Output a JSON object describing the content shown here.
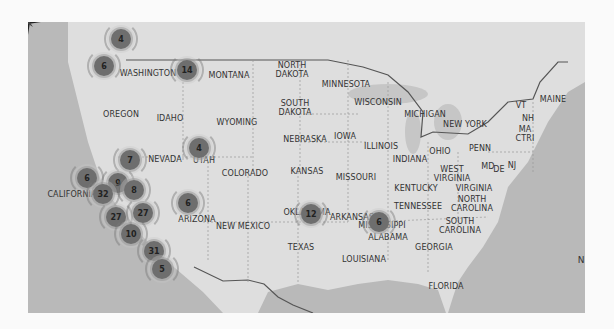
{
  "map": {
    "states": [
      {
        "name": "WASHINGTON",
        "x": 148,
        "y": 73
      },
      {
        "name": "MONTANA",
        "x": 229,
        "y": 75
      },
      {
        "name": "NORTH\nDAKOTA",
        "x": 292,
        "y": 70
      },
      {
        "name": "MINNESOTA",
        "x": 346,
        "y": 84
      },
      {
        "name": "OREGON",
        "x": 121,
        "y": 114
      },
      {
        "name": "IDAHO",
        "x": 170,
        "y": 118
      },
      {
        "name": "WYOMING",
        "x": 237,
        "y": 122
      },
      {
        "name": "SOUTH\nDAKOTA",
        "x": 295,
        "y": 108
      },
      {
        "name": "WISCONSIN",
        "x": 378,
        "y": 102
      },
      {
        "name": "MICHIGAN",
        "x": 425,
        "y": 114
      },
      {
        "name": "NEBRASKA",
        "x": 305,
        "y": 139
      },
      {
        "name": "IOWA",
        "x": 345,
        "y": 136
      },
      {
        "name": "ILLINOIS",
        "x": 381,
        "y": 146
      },
      {
        "name": "INDIANA",
        "x": 410,
        "y": 159
      },
      {
        "name": "OHIO",
        "x": 440,
        "y": 151
      },
      {
        "name": "PENN",
        "x": 480,
        "y": 148
      },
      {
        "name": "NEW YORK",
        "x": 465,
        "y": 124
      },
      {
        "name": "VT",
        "x": 521,
        "y": 105
      },
      {
        "name": "NH",
        "x": 528,
        "y": 118
      },
      {
        "name": "MA\nCTRI",
        "x": 525,
        "y": 134
      },
      {
        "name": "MAINE",
        "x": 553,
        "y": 99
      },
      {
        "name": "NEVADA",
        "x": 165,
        "y": 159
      },
      {
        "name": "UTAH",
        "x": 204,
        "y": 160
      },
      {
        "name": "COLORADO",
        "x": 245,
        "y": 173
      },
      {
        "name": "KANSAS",
        "x": 307,
        "y": 171
      },
      {
        "name": "MISSOURI",
        "x": 356,
        "y": 177
      },
      {
        "name": "WEST\nVIRGINIA",
        "x": 452,
        "y": 174
      },
      {
        "name": "MD",
        "x": 488,
        "y": 166
      },
      {
        "name": "DE",
        "x": 499,
        "y": 169
      },
      {
        "name": "NJ",
        "x": 512,
        "y": 165
      },
      {
        "name": "KENTUCKY",
        "x": 416,
        "y": 188
      },
      {
        "name": "VIRGINIA",
        "x": 474,
        "y": 188
      },
      {
        "name": "NORTH\nCAROLINA",
        "x": 472,
        "y": 204
      },
      {
        "name": "TENNESSEE",
        "x": 418,
        "y": 206
      },
      {
        "name": "CALIFORNIA",
        "x": 72,
        "y": 194
      },
      {
        "name": "ARIZONA",
        "x": 197,
        "y": 219
      },
      {
        "name": "NEW MEXICO",
        "x": 243,
        "y": 226
      },
      {
        "name": "OKLAHOMA",
        "x": 307,
        "y": 212
      },
      {
        "name": "ARKANSAS",
        "x": 352,
        "y": 217
      },
      {
        "name": "MISSISSIPPI",
        "x": 382,
        "y": 225
      },
      {
        "name": "SOUTH\nCAROLINA",
        "x": 460,
        "y": 226
      },
      {
        "name": "ALABAMA",
        "x": 388,
        "y": 237
      },
      {
        "name": "GEORGIA",
        "x": 434,
        "y": 247
      },
      {
        "name": "TEXAS",
        "x": 301,
        "y": 247
      },
      {
        "name": "LOUISIANA",
        "x": 364,
        "y": 259
      },
      {
        "name": "FLORIDA",
        "x": 446,
        "y": 286
      }
    ],
    "clusters": [
      {
        "count": "4",
        "x": 121,
        "y": 17
      },
      {
        "count": "6",
        "x": 104,
        "y": 44
      },
      {
        "count": "14",
        "x": 187,
        "y": 48
      },
      {
        "count": "4",
        "x": 199,
        "y": 126
      },
      {
        "count": "7",
        "x": 130,
        "y": 138
      },
      {
        "count": "6",
        "x": 87,
        "y": 156
      },
      {
        "count": "9",
        "x": 118,
        "y": 161
      },
      {
        "count": "8",
        "x": 134,
        "y": 168
      },
      {
        "count": "32",
        "x": 103,
        "y": 172
      },
      {
        "count": "27",
        "x": 116,
        "y": 195
      },
      {
        "count": "27",
        "x": 143,
        "y": 191
      },
      {
        "count": "10",
        "x": 131,
        "y": 212
      },
      {
        "count": "31",
        "x": 154,
        "y": 229
      },
      {
        "count": "5",
        "x": 162,
        "y": 247
      },
      {
        "count": "6",
        "x": 188,
        "y": 181
      },
      {
        "count": "12",
        "x": 311,
        "y": 192
      },
      {
        "count": "6",
        "x": 379,
        "y": 200
      }
    ],
    "compass": {
      "label": "N"
    }
  },
  "colors": {
    "water": "#b9b9b9",
    "land": "#dcdcdc",
    "cluster": "#6e6e6e"
  }
}
